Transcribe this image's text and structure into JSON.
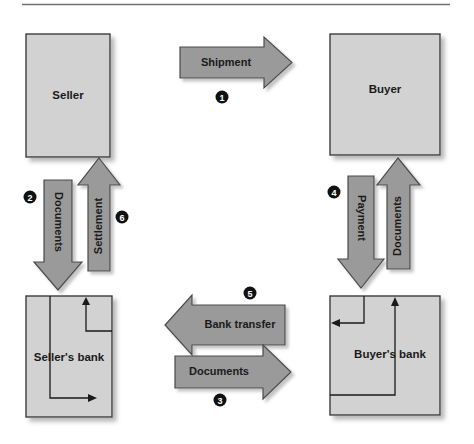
{
  "figure": {
    "title_rule": true,
    "background": "#ffffff",
    "palette": {
      "box_fill": "#d2d2d2",
      "box_stroke": "#3c3c3c",
      "arrow_fill": "#9a9a9a",
      "arrow_stroke": "#4a4a4a",
      "shadow": "#c9c9c9",
      "text": "#1a1a1a",
      "badge_fill": "#111111",
      "badge_text": "#ffffff",
      "rule": "#7a7a7a",
      "flow_line": "#1a1a1a"
    }
  },
  "boxes": [
    {
      "id": "seller",
      "label": "Seller",
      "x": 26,
      "y": 34,
      "w": 84,
      "h": 123
    },
    {
      "id": "buyer",
      "label": "Buyer",
      "x": 330,
      "y": 34,
      "w": 110,
      "h": 121
    },
    {
      "id": "sellers_bank",
      "label": "Seller's bank",
      "x": 26,
      "y": 296,
      "w": 86,
      "h": 121
    },
    {
      "id": "buyers_bank",
      "label": "Buyer's bank",
      "x": 330,
      "y": 296,
      "w": 110,
      "h": 119
    }
  ],
  "arrows": [
    {
      "id": "shipment",
      "label": "Shipment",
      "direction": "right",
      "step": "1"
    },
    {
      "id": "documents_sb",
      "label": "Documents",
      "direction": "down",
      "step": "2"
    },
    {
      "id": "documents_mid",
      "label": "Documents",
      "direction": "right",
      "step": "3"
    },
    {
      "id": "payment",
      "label": "Payment",
      "direction": "down",
      "step": "4"
    },
    {
      "id": "bank_transfer",
      "label": "Bank transfer",
      "direction": "left",
      "step": "5"
    },
    {
      "id": "settlement",
      "label": "Settlement",
      "direction": "up",
      "step": "6"
    },
    {
      "id": "documents_bb",
      "label": "Documents",
      "direction": "up",
      "step": ""
    }
  ],
  "steps": [
    {
      "n": "1",
      "glyph": "❶",
      "x": 222,
      "y": 97,
      "label": "Shipment"
    },
    {
      "n": "2",
      "glyph": "❷",
      "x": 30,
      "y": 197,
      "label": "Documents"
    },
    {
      "n": "3",
      "glyph": "❸",
      "x": 220,
      "y": 400,
      "label": "Documents"
    },
    {
      "n": "4",
      "glyph": "❹",
      "x": 334,
      "y": 192,
      "label": "Payment"
    },
    {
      "n": "5",
      "glyph": "❺",
      "x": 250,
      "y": 293,
      "label": "Bank transfer"
    },
    {
      "n": "6",
      "glyph": "❻",
      "x": 122,
      "y": 217,
      "label": "Settlement"
    }
  ]
}
